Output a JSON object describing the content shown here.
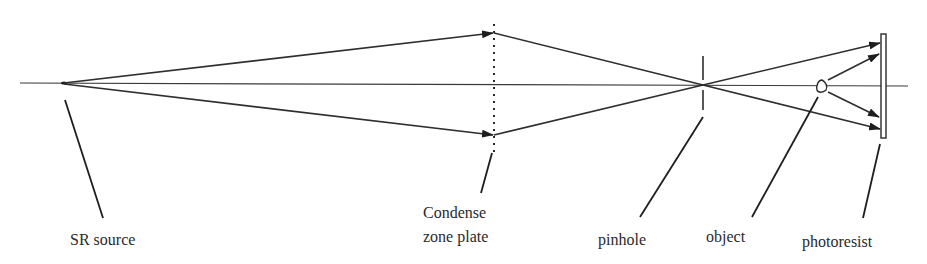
{
  "diagram": {
    "title": "",
    "labels": {
      "source": "SR source",
      "zone_plate_line1": "Condense",
      "zone_plate_line2": "zone plate",
      "pinhole": "pinhole",
      "object": "object",
      "photoresist": "photoresist"
    },
    "colors": {
      "line": "#2e2e2e",
      "text": "#2a2a2a",
      "background": "#ffffff"
    },
    "components": [
      {
        "id": "sr-source",
        "label": "SR source",
        "x": 63,
        "y": 83
      },
      {
        "id": "condense-zone-plate",
        "label": "Condense zone plate",
        "x": 494,
        "y_top": 24,
        "y_bottom": 152,
        "style": "dotted"
      },
      {
        "id": "pinhole",
        "label": "pinhole",
        "x": 703,
        "y_top": 56,
        "y_bottom": 110
      },
      {
        "id": "object",
        "label": "object",
        "x": 822,
        "y": 86
      },
      {
        "id": "photoresist",
        "label": "photoresist",
        "x": 884,
        "y_top": 34,
        "y_bottom": 138
      }
    ]
  }
}
